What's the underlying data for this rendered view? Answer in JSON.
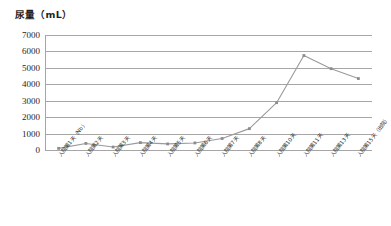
{
  "chart_data": {
    "type": "line",
    "title": "尿量（mL）",
    "xlabel": "",
    "ylabel": "尿量（mL）",
    "ylim": [
      0,
      7000
    ],
    "ytick_values": [
      7000,
      6000,
      5000,
      4000,
      3000,
      2000,
      1000,
      0
    ],
    "ytick_labels": [
      "7000",
      "6000",
      "5000",
      "4000",
      "3000",
      "2000",
      "1000",
      "0"
    ],
    "grid": true,
    "legend": "none",
    "series_color": "#9a9a9a",
    "marker_color": "#8c8c8c",
    "categories": [
      "入院第1天（Nb）",
      "入院第2天",
      "入院第3天",
      "入院第4天",
      "入院第5天",
      "入院第6天",
      "入院第7天",
      "入院第8天",
      "入院第10天",
      "入院第11天",
      "入院第13天",
      "入院第15天（出院）"
    ],
    "values": [
      100,
      400,
      180,
      450,
      370,
      430,
      700,
      1300,
      2880,
      5750,
      4950,
      4350
    ]
  }
}
